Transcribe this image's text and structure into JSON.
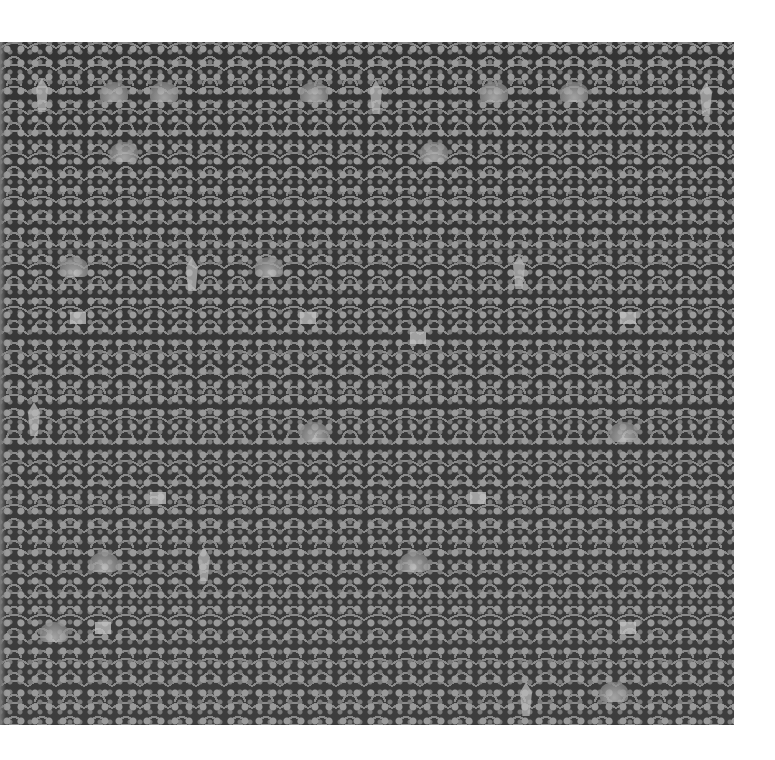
{
  "image": {
    "subject": "grayscale photograph of a densely patterned woven textile",
    "background_color": "#ffffff",
    "textile_ground_color": "#3a3a3a",
    "textile_motif_color": "#b9b9b9"
  },
  "motifs": [
    {
      "type": "spire",
      "x": 36,
      "y": 36
    },
    {
      "type": "spire",
      "x": 186,
      "y": 215
    },
    {
      "type": "spire",
      "x": 513,
      "y": 213
    },
    {
      "type": "spire",
      "x": 28,
      "y": 360
    },
    {
      "type": "spire",
      "x": 198,
      "y": 505
    },
    {
      "type": "spire",
      "x": 520,
      "y": 640
    },
    {
      "type": "spire",
      "x": 370,
      "y": 38
    },
    {
      "type": "spire",
      "x": 700,
      "y": 40
    },
    {
      "type": "fan",
      "x": 100,
      "y": 40
    },
    {
      "type": "fan",
      "x": 150,
      "y": 40
    },
    {
      "type": "fan",
      "x": 300,
      "y": 40
    },
    {
      "type": "fan",
      "x": 480,
      "y": 40
    },
    {
      "type": "fan",
      "x": 560,
      "y": 40
    },
    {
      "type": "fan",
      "x": 110,
      "y": 100
    },
    {
      "type": "fan",
      "x": 420,
      "y": 100
    },
    {
      "type": "fan",
      "x": 60,
      "y": 215
    },
    {
      "type": "fan",
      "x": 255,
      "y": 215
    },
    {
      "type": "fan",
      "x": 300,
      "y": 380
    },
    {
      "type": "fan",
      "x": 610,
      "y": 380
    },
    {
      "type": "fan",
      "x": 90,
      "y": 510
    },
    {
      "type": "fan",
      "x": 400,
      "y": 510
    },
    {
      "type": "fan",
      "x": 600,
      "y": 640
    },
    {
      "type": "fan",
      "x": 40,
      "y": 580
    },
    {
      "type": "box",
      "x": 70,
      "y": 270
    },
    {
      "type": "box",
      "x": 300,
      "y": 270
    },
    {
      "type": "box",
      "x": 410,
      "y": 290
    },
    {
      "type": "box",
      "x": 620,
      "y": 270
    },
    {
      "type": "box",
      "x": 150,
      "y": 450
    },
    {
      "type": "box",
      "x": 470,
      "y": 450
    },
    {
      "type": "box",
      "x": 620,
      "y": 580
    },
    {
      "type": "box",
      "x": 95,
      "y": 580
    }
  ]
}
